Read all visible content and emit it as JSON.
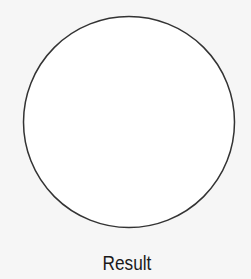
{
  "figure": {
    "shape": "circle",
    "stroke_color": "#333333",
    "fill_color": "#ffffff",
    "caption": "Result"
  }
}
